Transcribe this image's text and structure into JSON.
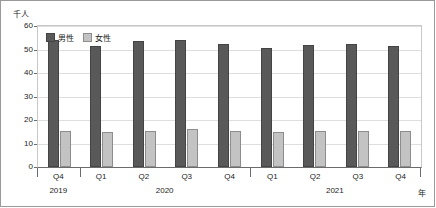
{
  "chart_data": {
    "type": "bar",
    "title": "",
    "subtitle": "",
    "ylabel": "千人",
    "xlabel": "年",
    "ylim": [
      0,
      60
    ],
    "yticks": [
      0,
      10,
      20,
      30,
      40,
      50,
      60
    ],
    "grid": true,
    "legend_position": "top-left",
    "categories": [
      "Q4",
      "Q1",
      "Q2",
      "Q3",
      "Q4",
      "Q1",
      "Q2",
      "Q3",
      "Q4"
    ],
    "year_groups": [
      {
        "label": "2019",
        "quarters": [
          "Q4"
        ]
      },
      {
        "label": "2020",
        "quarters": [
          "Q1",
          "Q2",
          "Q3",
          "Q4"
        ]
      },
      {
        "label": "2021",
        "quarters": [
          "Q1",
          "Q2",
          "Q3",
          "Q4"
        ]
      }
    ],
    "series": [
      {
        "name": "男性",
        "color": "#595959",
        "values": [
          54,
          51.5,
          53.5,
          54,
          52.5,
          50.5,
          52,
          52.5,
          51.5
        ]
      },
      {
        "name": "女性",
        "color": "#c3c3c3",
        "values": [
          15.5,
          15,
          15.5,
          16,
          15.5,
          15,
          15.5,
          15.5,
          15.5
        ]
      }
    ]
  },
  "legend": {
    "items": [
      {
        "label": "男性"
      },
      {
        "label": "女性"
      }
    ]
  },
  "axes": {
    "y_unit": "千人",
    "x_unit": "年",
    "y_ticks": [
      "60",
      "50",
      "40",
      "30",
      "20",
      "10",
      "0"
    ]
  }
}
